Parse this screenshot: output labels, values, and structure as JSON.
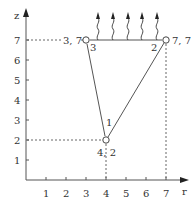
{
  "diagram": {
    "axes": {
      "x_label": "r",
      "y_label": "z",
      "x_ticks": [
        "1",
        "2",
        "3",
        "4",
        "5",
        "6",
        "7"
      ],
      "y_ticks": [
        "1",
        "2",
        "3",
        "4",
        "5",
        "6",
        "7"
      ]
    },
    "nodes": [
      {
        "id": "1",
        "r": 4,
        "z": 2,
        "coord_label": "4, 2"
      },
      {
        "id": "2",
        "r": 7,
        "z": 7,
        "coord_label": "7, 7"
      },
      {
        "id": "3",
        "r": 3,
        "z": 7,
        "coord_label": "3, 7"
      }
    ],
    "edges": [
      [
        "1",
        "2"
      ],
      [
        "2",
        "3"
      ],
      [
        "3",
        "1"
      ]
    ],
    "flux_arrows": {
      "count": 5,
      "edge": "2-3",
      "direction": "up"
    },
    "colors": {
      "line": "#555555",
      "text": "#333333",
      "background": "#ffffff"
    }
  }
}
